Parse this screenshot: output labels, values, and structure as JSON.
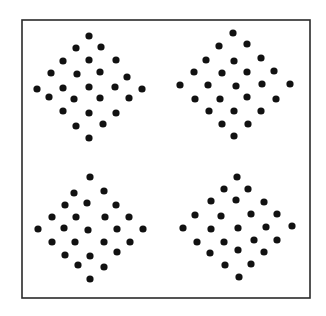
{
  "figure": {
    "width": 326,
    "height": 316,
    "background": "#ffffff",
    "frame": {
      "x1": 22,
      "y1": 20,
      "x2": 310,
      "y2": 298,
      "color": "#2a2a2a",
      "stroke_width": 1.6
    },
    "dot_color": "#111111",
    "dot_radius": 3.6,
    "panels": [
      {
        "name": "top-left-diamond",
        "dot_count": 25,
        "dots": [
          [
            89,
            36
          ],
          [
            76,
            48
          ],
          [
            101,
            47
          ],
          [
            63,
            61
          ],
          [
            89,
            60
          ],
          [
            116,
            60
          ],
          [
            51,
            73
          ],
          [
            77,
            74
          ],
          [
            100,
            72
          ],
          [
            127,
            77
          ],
          [
            37,
            89
          ],
          [
            63,
            88
          ],
          [
            89,
            87
          ],
          [
            115,
            87
          ],
          [
            142,
            89
          ],
          [
            49,
            97
          ],
          [
            74,
            99
          ],
          [
            100,
            98
          ],
          [
            129,
            98
          ],
          [
            63,
            111
          ],
          [
            89,
            113
          ],
          [
            116,
            113
          ],
          [
            76,
            126
          ],
          [
            103,
            124
          ],
          [
            89,
            138
          ]
        ]
      },
      {
        "name": "top-right-diamond",
        "dot_count": 25,
        "dots": [
          [
            233,
            33
          ],
          [
            219,
            46
          ],
          [
            247,
            44
          ],
          [
            206,
            60
          ],
          [
            234,
            61
          ],
          [
            261,
            58
          ],
          [
            194,
            72
          ],
          [
            222,
            73
          ],
          [
            247,
            72
          ],
          [
            274,
            71
          ],
          [
            180,
            85
          ],
          [
            208,
            85
          ],
          [
            236,
            86
          ],
          [
            262,
            84
          ],
          [
            290,
            84
          ],
          [
            195,
            99
          ],
          [
            220,
            99
          ],
          [
            247,
            97
          ],
          [
            276,
            99
          ],
          [
            209,
            111
          ],
          [
            234,
            111
          ],
          [
            261,
            111
          ],
          [
            222,
            124
          ],
          [
            248,
            124
          ],
          [
            234,
            136
          ]
        ]
      },
      {
        "name": "bottom-left-diamond",
        "dot_count": 25,
        "dots": [
          [
            90,
            177
          ],
          [
            74,
            193
          ],
          [
            104,
            191
          ],
          [
            65,
            205
          ],
          [
            87,
            203
          ],
          [
            116,
            205
          ],
          [
            52,
            217
          ],
          [
            76,
            217
          ],
          [
            105,
            217
          ],
          [
            129,
            217
          ],
          [
            38,
            229
          ],
          [
            64,
            228
          ],
          [
            88,
            230
          ],
          [
            117,
            229
          ],
          [
            143,
            229
          ],
          [
            52,
            242
          ],
          [
            75,
            242
          ],
          [
            104,
            242
          ],
          [
            130,
            242
          ],
          [
            65,
            255
          ],
          [
            90,
            256
          ],
          [
            117,
            252
          ],
          [
            78,
            265
          ],
          [
            104,
            267
          ],
          [
            90,
            279
          ]
        ]
      },
      {
        "name": "bottom-right-diamond",
        "dot_count": 25,
        "dots": [
          [
            237,
            177
          ],
          [
            224,
            189
          ],
          [
            248,
            189
          ],
          [
            211,
            201
          ],
          [
            236,
            200
          ],
          [
            264,
            202
          ],
          [
            195,
            215
          ],
          [
            221,
            216
          ],
          [
            251,
            214
          ],
          [
            277,
            214
          ],
          [
            183,
            228
          ],
          [
            211,
            229
          ],
          [
            238,
            228
          ],
          [
            266,
            227
          ],
          [
            292,
            226
          ],
          [
            197,
            242
          ],
          [
            224,
            242
          ],
          [
            254,
            240
          ],
          [
            277,
            240
          ],
          [
            210,
            253
          ],
          [
            238,
            250
          ],
          [
            264,
            252
          ],
          [
            225,
            265
          ],
          [
            251,
            264
          ],
          [
            239,
            277
          ]
        ]
      }
    ]
  }
}
